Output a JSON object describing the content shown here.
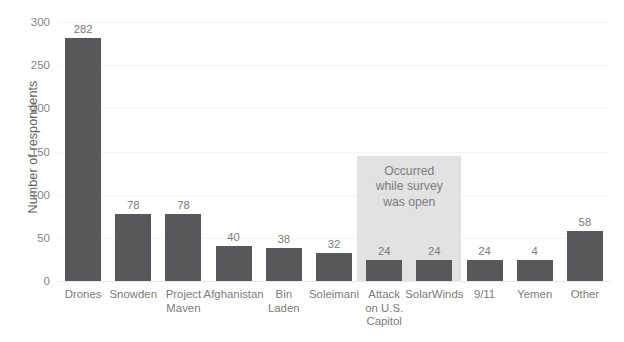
{
  "chart_data": {
    "type": "bar",
    "title": "",
    "xlabel": "",
    "ylabel": "Number of respondents",
    "ylim": [
      0,
      300
    ],
    "yticks": [
      0,
      50,
      100,
      150,
      200,
      250,
      300
    ],
    "grid": true,
    "legend": "none",
    "categories": [
      "Drones",
      "Snowden",
      "Project\nMaven",
      "Afghanistan",
      "Bin\nLaden",
      "Soleimani",
      "Attack\non U.S.\nCapitol",
      "SolarWinds",
      "9/11",
      "Yemen",
      "Other"
    ],
    "values": [
      282,
      78,
      78,
      40,
      38,
      32,
      24,
      24,
      24,
      4,
      58
    ],
    "value_labels": [
      "282",
      "78",
      "78",
      "40",
      "38",
      "32",
      "24",
      "24",
      "24",
      "4",
      "58"
    ],
    "bar_pixel_values": [
      282,
      78,
      78,
      40,
      38,
      32,
      24,
      24,
      24,
      24,
      58
    ],
    "annotations": [
      {
        "text": "Occurred\nwhile survey\nwas open",
        "covers_categories": [
          "Attack\non U.S.\nCapitol",
          "SolarWinds"
        ],
        "band_start_index": 6,
        "band_end_index": 7
      }
    ],
    "colors": {
      "bar": "#58585a",
      "annotation_band": "#e2e2e2",
      "annotation_text": "#7d7d7d",
      "gridline": "#f4f4f4",
      "baseline": "#e9e9e9",
      "tick_label": "#848484",
      "axis_title": "#636363",
      "background": "#ffffff"
    }
  }
}
